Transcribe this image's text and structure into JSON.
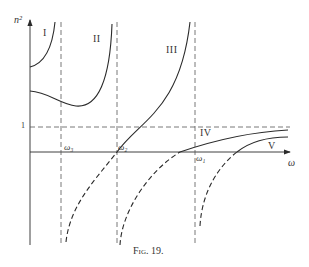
{
  "figure": {
    "caption": "Fig. 19.",
    "y_axis_label": "n²",
    "x_axis_label": "ω",
    "unity_tick_label": "1",
    "frequency_labels": {
      "omega3": "ω₃",
      "omega2": "ω₂",
      "omega1": "ω₁"
    },
    "branch_labels": [
      "I",
      "II",
      "III",
      "IV",
      "V"
    ]
  },
  "colors": {
    "line": "#2a2a2a",
    "dashed_guide": "#555555",
    "background": "#ffffff"
  }
}
